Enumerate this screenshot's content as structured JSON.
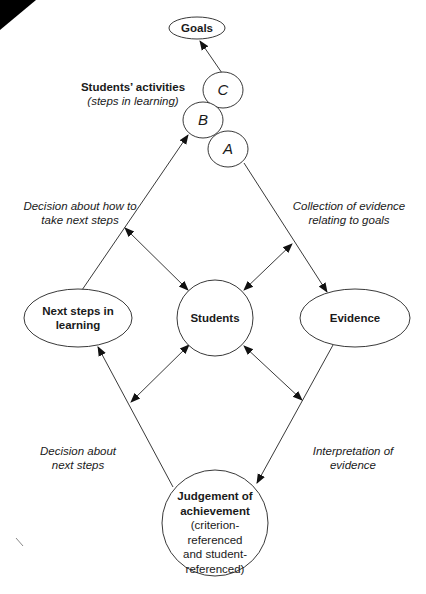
{
  "diagram": {
    "nodes": {
      "goals": {
        "label": "Goals"
      },
      "step_c": {
        "label": "C"
      },
      "step_b": {
        "label": "B"
      },
      "step_a": {
        "label": "A"
      },
      "next_steps": {
        "line1": "Next steps in",
        "line2": "learning"
      },
      "students": {
        "label": "Students"
      },
      "evidence": {
        "label": "Evidence"
      },
      "judgement": {
        "line1": "Judgement of",
        "line2": "achievement",
        "line3": "(criterion-",
        "line4": "referenced",
        "line5": "and student-",
        "line6": "referenced)"
      }
    },
    "labels": {
      "activities_title": "Students’ activities",
      "activities_subtitle": "(steps in learning)",
      "decision_how_line1": "Decision about how to",
      "decision_how_line2": "take next steps",
      "collection_line1": "Collection of evidence",
      "collection_line2": "relating to goals",
      "decision_next_line1": "Decision about",
      "decision_next_line2": "next steps",
      "interpretation_line1": "Interpretation of",
      "interpretation_line2": "evidence"
    },
    "edges": [
      {
        "from": "Step C",
        "to": "Goals",
        "type": "arrow"
      },
      {
        "from": "Next steps in learning",
        "to": "Step B",
        "type": "arrow"
      },
      {
        "from": "Step A",
        "to": "Evidence",
        "type": "arrow"
      },
      {
        "from": "Evidence",
        "to": "Judgement of achievement",
        "type": "arrow"
      },
      {
        "from": "Judgement of achievement",
        "to": "Next steps in learning",
        "type": "arrow"
      },
      {
        "from": "Students",
        "to": "Decision about how to take next steps",
        "type": "double-arrow"
      },
      {
        "from": "Students",
        "to": "Collection of evidence relating to goals",
        "type": "double-arrow"
      },
      {
        "from": "Students",
        "to": "Decision about next steps",
        "type": "double-arrow"
      },
      {
        "from": "Students",
        "to": "Interpretation of evidence",
        "type": "double-arrow"
      }
    ]
  }
}
